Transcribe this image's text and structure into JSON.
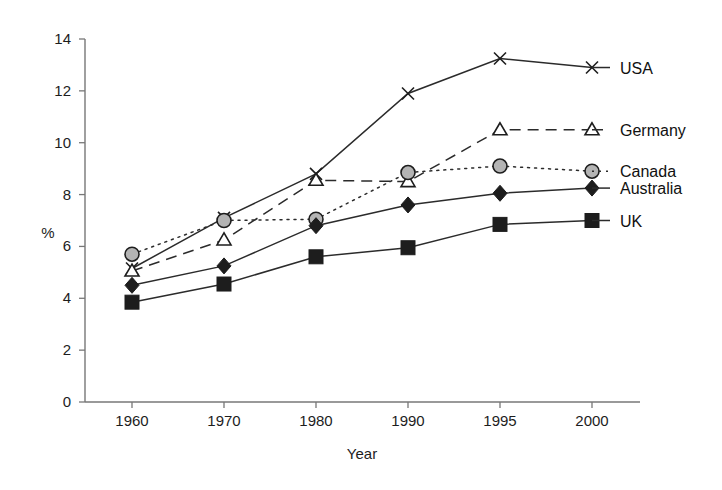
{
  "chart_data": {
    "type": "line",
    "title": "",
    "xlabel": "Year",
    "ylabel": "%",
    "categories": [
      "1960",
      "1970",
      "1980",
      "1990",
      "1995",
      "2000"
    ],
    "ylim": [
      0,
      14
    ],
    "yticks": [
      0,
      2,
      4,
      6,
      8,
      10,
      12,
      14
    ],
    "grid": false,
    "legend_position": "inline-right-of-line-end",
    "series": [
      {
        "name": "USA",
        "marker": "x",
        "linestyle": "solid",
        "color": "#2b2b2b",
        "values": [
          5.15,
          7.1,
          8.8,
          11.9,
          13.25,
          12.9
        ]
      },
      {
        "name": "Germany",
        "marker": "triangle-open",
        "linestyle": "dashed",
        "color": "#2b2b2b",
        "values": [
          5.05,
          6.25,
          8.55,
          8.5,
          10.5,
          10.5
        ]
      },
      {
        "name": "Canada",
        "marker": "circle-gray",
        "linestyle": "dotted",
        "color": "#2b2b2b",
        "values": [
          5.7,
          7.0,
          7.05,
          8.85,
          9.1,
          8.9
        ]
      },
      {
        "name": "Australia",
        "marker": "diamond-filled",
        "linestyle": "solid",
        "color": "#2b2b2b",
        "values": [
          4.5,
          5.25,
          6.8,
          7.6,
          8.05,
          8.25
        ]
      },
      {
        "name": "UK",
        "marker": "square-filled",
        "linestyle": "solid",
        "color": "#2b2b2b",
        "values": [
          3.85,
          4.55,
          5.6,
          5.95,
          6.85,
          7.0
        ]
      }
    ]
  },
  "axes": {
    "y_tick_labels": [
      "0",
      "2",
      "4",
      "6",
      "8",
      "10",
      "12",
      "14"
    ],
    "x_tick_labels": [
      "1960",
      "1970",
      "1980",
      "1990",
      "1995",
      "2000"
    ],
    "y_axis_title": "%",
    "x_axis_title": "Year"
  },
  "legend": {
    "items": [
      {
        "label": "USA"
      },
      {
        "label": "Germany"
      },
      {
        "label": "Canada"
      },
      {
        "label": "Australia"
      },
      {
        "label": "UK"
      }
    ]
  }
}
